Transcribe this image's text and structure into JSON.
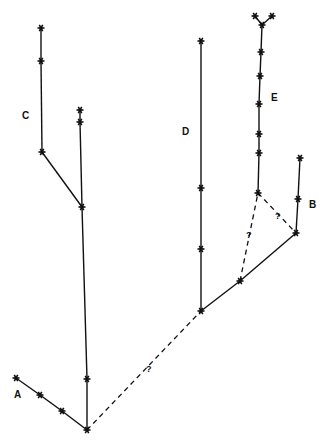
{
  "diagram": {
    "type": "branching lineage tree",
    "labels": {
      "A": "A",
      "B": "B",
      "C": "C",
      "D": "D",
      "E": "E"
    },
    "uncertain_marker": "?",
    "nodes": {
      "a1": [
        16,
        378
      ],
      "a2": [
        40,
        395
      ],
      "a3": [
        62,
        411
      ],
      "root": [
        87,
        430
      ],
      "t1": [
        87,
        379
      ],
      "t2": [
        82,
        207
      ],
      "t3": [
        80,
        122
      ],
      "t4": [
        80,
        110
      ],
      "c1": [
        42,
        152
      ],
      "c2": [
        41,
        61
      ],
      "c3": [
        41,
        28
      ],
      "d0": [
        201,
        311
      ],
      "d1": [
        201,
        249
      ],
      "d2": [
        201,
        188
      ],
      "d3": [
        201,
        41
      ],
      "m": [
        240,
        281
      ],
      "b0": [
        296,
        233
      ],
      "b1": [
        298,
        199
      ],
      "b2": [
        300,
        158
      ],
      "e0": [
        258,
        193
      ],
      "e1": [
        259,
        153
      ],
      "e2": [
        259,
        134
      ],
      "e3": [
        259,
        104
      ],
      "e4": [
        260,
        76
      ],
      "e5": [
        261,
        52
      ],
      "e6": [
        262,
        25
      ],
      "e7": [
        255,
        16
      ],
      "e8": [
        272,
        16
      ]
    },
    "solid_edges": [
      [
        "a1",
        "a2"
      ],
      [
        "a2",
        "a3"
      ],
      [
        "a3",
        "root"
      ],
      [
        "root",
        "t1"
      ],
      [
        "t1",
        "t2"
      ],
      [
        "t2",
        "t3"
      ],
      [
        "t3",
        "t4"
      ],
      [
        "t2",
        "c1"
      ],
      [
        "c1",
        "c2"
      ],
      [
        "c2",
        "c3"
      ],
      [
        "d0",
        "d1"
      ],
      [
        "d1",
        "d2"
      ],
      [
        "d2",
        "d3"
      ],
      [
        "d0",
        "m"
      ],
      [
        "m",
        "b0"
      ],
      [
        "b0",
        "b1"
      ],
      [
        "b1",
        "b2"
      ],
      [
        "e0",
        "e1"
      ],
      [
        "e1",
        "e2"
      ],
      [
        "e2",
        "e3"
      ],
      [
        "e3",
        "e4"
      ],
      [
        "e4",
        "e5"
      ],
      [
        "e5",
        "e6"
      ],
      [
        "e6",
        "e7"
      ],
      [
        "e6",
        "e8"
      ]
    ],
    "dashed_edges": [
      [
        "root",
        "d0"
      ],
      [
        "m",
        "e0"
      ],
      [
        "e0",
        "b0"
      ]
    ],
    "label_positions": {
      "A": [
        14,
        398
      ],
      "B": [
        309,
        208
      ],
      "C": [
        22,
        119
      ],
      "D": [
        182,
        135
      ],
      "E": [
        271,
        101
      ]
    },
    "question_positions": [
      [
        146,
        372
      ],
      [
        246,
        238
      ],
      [
        275,
        219
      ]
    ]
  }
}
